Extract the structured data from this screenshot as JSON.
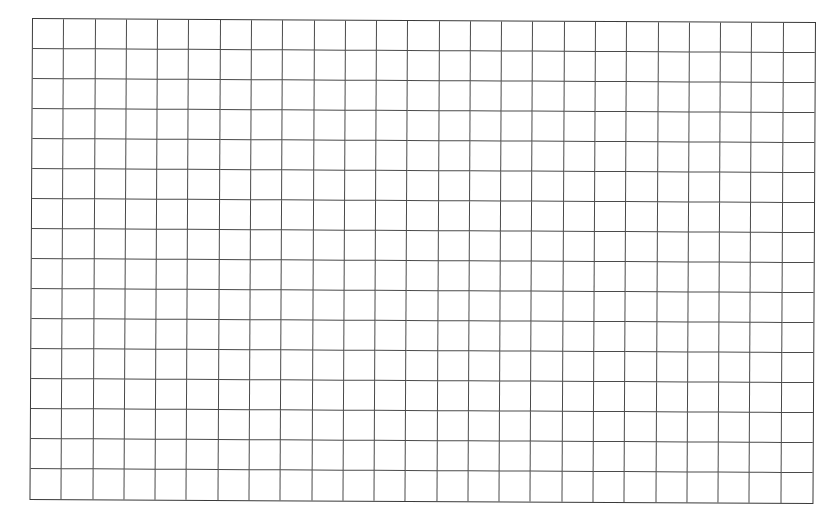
{
  "sheet": {
    "type": "blank grid paper",
    "columns": 25,
    "rows": 16,
    "line_color": "#4a4a4a",
    "background": "#ffffff"
  }
}
